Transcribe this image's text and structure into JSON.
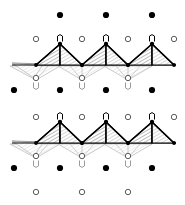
{
  "figure": {
    "title": "Chain of corner-sharing tetrahedra in projection",
    "width": 185,
    "height": 205,
    "background": "#ffffff"
  },
  "palette": {
    "filled_atom": "#000000",
    "open_atom_stroke": "#4a4a4a",
    "open_atom_fill": "#ffffff",
    "tetra_edge_dark": "#000000",
    "tetra_face_hatch": "#777777",
    "tetra_ghost_edge": "#b4b4b4",
    "tetra_ghost_hatch": "#cfcfcf",
    "bond_line": "#9a9a9a"
  },
  "geometry": {
    "filled_radius": 3.1,
    "open_radius": 2.7,
    "apex_cap_width": 5,
    "apex_cap_height": 7
  },
  "atoms": {
    "filled_label": "filled-circle-atom",
    "open_label": "open-circle-atom",
    "apex_label": "apex-cap-marker",
    "rows": [
      {
        "name": "row-filled-top",
        "kind": "filled",
        "y": 15,
        "x": [
          60,
          106,
          152
        ]
      },
      {
        "name": "row-open-upper-1",
        "kind": "open",
        "y": 39,
        "x": [
          36,
          82,
          128,
          174
        ]
      },
      {
        "name": "row-apex-upper-1",
        "kind": "apex",
        "y": 38,
        "x": [
          60,
          106,
          152
        ]
      },
      {
        "name": "row-open-mid-upper",
        "kind": "open",
        "y": 78,
        "x": [
          36,
          82,
          128
        ]
      },
      {
        "name": "row-apex-down-upper",
        "kind": "apex-down",
        "y": 86,
        "x": [
          36,
          82,
          128
        ]
      },
      {
        "name": "row-filled-mid",
        "kind": "filled",
        "y": 90,
        "x": [
          14,
          60,
          106,
          152
        ]
      },
      {
        "name": "row-open-lower-1",
        "kind": "open",
        "y": 117,
        "x": [
          36,
          82,
          128,
          174
        ]
      },
      {
        "name": "row-apex-lower-1",
        "kind": "apex",
        "y": 116,
        "x": [
          60,
          106,
          152
        ]
      },
      {
        "name": "row-open-mid-lower",
        "kind": "open",
        "y": 156,
        "x": [
          36,
          82,
          128
        ]
      },
      {
        "name": "row-apex-down-lower",
        "kind": "apex-down",
        "y": 164,
        "x": [
          36,
          82,
          128
        ]
      },
      {
        "name": "row-filled-bottom",
        "kind": "filled",
        "y": 168,
        "x": [
          14,
          60,
          106,
          152
        ]
      },
      {
        "name": "row-open-bottom",
        "kind": "open",
        "y": 192,
        "x": [
          36,
          82,
          128
        ]
      }
    ]
  },
  "chains": [
    {
      "name": "tetrahedra-chain-upper",
      "baseline_y": 65,
      "apex_y": 44,
      "ghost_y": 80,
      "apex_x": [
        60,
        106,
        152
      ],
      "base_x": [
        36,
        82,
        128,
        174
      ],
      "left_stub_x": 12,
      "right_end_x": 176
    },
    {
      "name": "tetrahedra-chain-lower",
      "baseline_y": 143,
      "apex_y": 122,
      "ghost_y": 158,
      "apex_x": [
        60,
        106,
        152
      ],
      "base_x": [
        36,
        82,
        128,
        174
      ],
      "left_stub_x": 12,
      "right_end_x": 176
    }
  ]
}
